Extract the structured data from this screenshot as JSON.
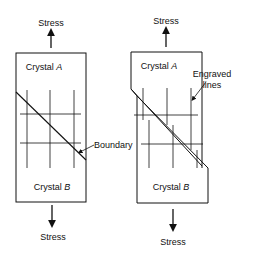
{
  "left": {
    "stress_top": "Stress",
    "stress_bottom": "Stress",
    "crystal_a": "Crystal",
    "crystal_a_letter": "A",
    "crystal_b": "Crystal",
    "crystal_b_letter": "B",
    "boundary_label": "Boundary"
  },
  "right": {
    "stress_top": "Stress",
    "stress_bottom": "Stress",
    "crystal_a": "Crystal",
    "crystal_a_letter": "A",
    "crystal_b": "Crystal",
    "crystal_b_letter": "B",
    "engraved_label_1": "Engraved",
    "engraved_label_2": "lines"
  },
  "colors": {
    "ink": "#111111",
    "background": "#ffffff"
  }
}
